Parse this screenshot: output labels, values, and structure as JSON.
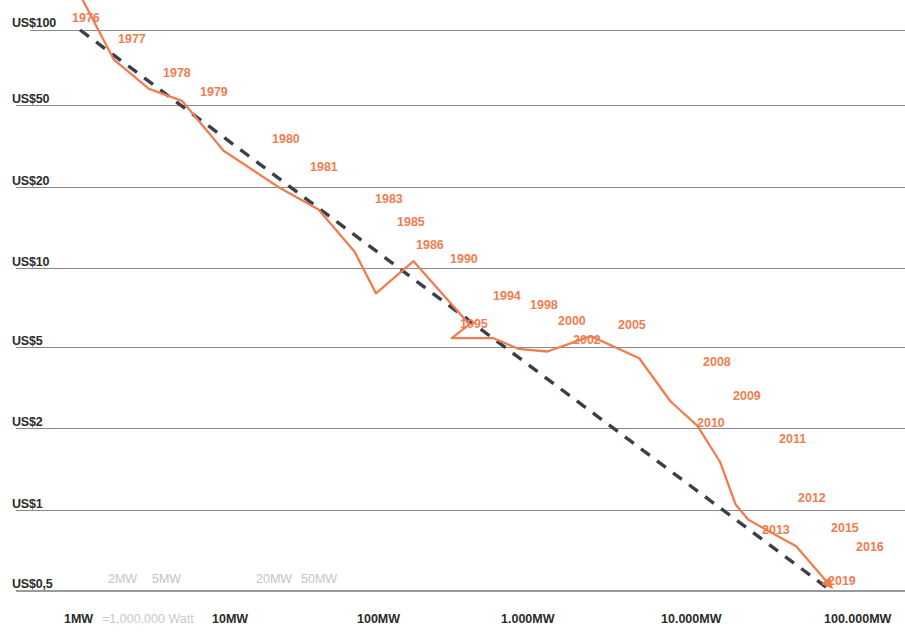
{
  "chart_data": {
    "type": "line",
    "title": "",
    "xlabel": "",
    "ylabel": "",
    "xscale": "log",
    "yscale": "log",
    "grid": true,
    "legend": "none",
    "xlim": [
      1,
      100000
    ],
    "ylim": [
      0.5,
      100
    ],
    "y_ticks": [
      "US$100",
      "US$50",
      "US$20",
      "US$10",
      "US$5",
      "US$2",
      "US$1",
      "US$0,5"
    ],
    "y_tick_values": [
      100,
      50,
      20,
      10,
      5,
      2,
      1,
      0.5
    ],
    "x_ticks_major": [
      "1MW",
      "10MW",
      "100MW",
      "1.000MW",
      "10.000MW",
      "100.000MW"
    ],
    "x_tick_major_values": [
      1,
      10,
      100,
      1000,
      10000,
      100000
    ],
    "x_ticks_minor": [
      "2MW",
      "5MW",
      "20MW",
      "50MW"
    ],
    "x_tick_minor_values": [
      2,
      5,
      20,
      50
    ],
    "x_note": "=1,000,000 Watt",
    "series": [
      {
        "name": "price-per-watt",
        "color": "#ef7d4e",
        "style": "solid",
        "points": [
          {
            "label": "1976",
            "x": 1.0,
            "y": 106.0
          },
          {
            "label": "1977",
            "x": 2.0,
            "y": 76.0
          },
          {
            "label": "1978",
            "x": 3.4,
            "y": 58.0
          },
          {
            "label": "1979",
            "x": 5.6,
            "y": 52.0
          },
          {
            "label": "1980",
            "x": 10.5,
            "y": 30.0
          },
          {
            "label": "1981",
            "x": 24.0,
            "y": 20.0
          },
          {
            "label": "1983",
            "x": 44.0,
            "y": 16.5
          },
          {
            "label": "1985",
            "x": 76.0,
            "y": 11.5
          },
          {
            "label": "1986",
            "x": 105.0,
            "y": 8.0
          },
          {
            "label": "1990",
            "x": 185.0,
            "y": 10.6
          },
          {
            "label": "1994",
            "x": 430.0,
            "y": 6.1
          },
          {
            "label": "1995",
            "x": 330.0,
            "y": 5.4
          },
          {
            "label": "1998",
            "x": 620.0,
            "y": 5.4
          },
          {
            "label": "2000",
            "x": 900.0,
            "y": 4.9
          },
          {
            "label": "2002",
            "x": 1400.0,
            "y": 4.75
          },
          {
            "label": "2005",
            "x": 2700.0,
            "y": 5.5
          },
          {
            "label": "2008",
            "x": 5600.0,
            "y": 4.4
          },
          {
            "label": "2009",
            "x": 9000.0,
            "y": 2.7
          },
          {
            "label": "2010",
            "x": 13500.0,
            "y": 2.05
          },
          {
            "label": "2011",
            "x": 19000.0,
            "y": 1.5
          },
          {
            "label": "2012",
            "x": 24000.0,
            "y": 1.05
          },
          {
            "label": "2013",
            "x": 29000.0,
            "y": 0.92
          },
          {
            "label": "2015",
            "x": 45000.0,
            "y": 0.8
          },
          {
            "label": "2016",
            "x": 60000.0,
            "y": 0.73
          },
          {
            "label": "2019",
            "x": 100000.0,
            "y": 0.52
          }
        ]
      },
      {
        "name": "learning-curve-trend",
        "color": "#39404c",
        "style": "dashed",
        "points": [
          {
            "x": 1.2,
            "y": 100.0
          },
          {
            "x": 100000.0,
            "y": 0.5
          }
        ]
      }
    ],
    "year_labels": [
      {
        "text": "1976",
        "x": 72,
        "y": 11
      },
      {
        "text": "1977",
        "x": 118,
        "y": 32
      },
      {
        "text": "1978",
        "x": 163,
        "y": 66
      },
      {
        "text": "1979",
        "x": 200,
        "y": 85
      },
      {
        "text": "1980",
        "x": 272,
        "y": 132
      },
      {
        "text": "1981",
        "x": 310,
        "y": 160
      },
      {
        "text": "1983",
        "x": 375,
        "y": 192
      },
      {
        "text": "1985",
        "x": 397,
        "y": 215
      },
      {
        "text": "1986",
        "x": 416,
        "y": 238
      },
      {
        "text": "1990",
        "x": 450,
        "y": 252
      },
      {
        "text": "1994",
        "x": 493,
        "y": 289
      },
      {
        "text": "1995",
        "x": 460,
        "y": 317
      },
      {
        "text": "1998",
        "x": 530,
        "y": 298
      },
      {
        "text": "2000",
        "x": 558,
        "y": 314
      },
      {
        "text": "2002",
        "x": 573,
        "y": 333
      },
      {
        "text": "2005",
        "x": 618,
        "y": 318
      },
      {
        "text": "2008",
        "x": 703,
        "y": 355
      },
      {
        "text": "2009",
        "x": 733,
        "y": 389
      },
      {
        "text": "2010",
        "x": 697,
        "y": 416
      },
      {
        "text": "2011",
        "x": 779,
        "y": 432
      },
      {
        "text": "2012",
        "x": 798,
        "y": 491
      },
      {
        "text": "2013",
        "x": 762,
        "y": 523
      },
      {
        "text": "2015",
        "x": 831,
        "y": 521
      },
      {
        "text": "2016",
        "x": 856,
        "y": 540
      },
      {
        "text": "2019",
        "x": 828,
        "y": 574
      }
    ],
    "gridline_y_px": [
      30,
      105,
      187,
      268,
      347,
      428,
      510,
      590
    ],
    "x_major_px": [
      68,
      215,
      360,
      505,
      665,
      830
    ],
    "x_minor_px": [
      110,
      153,
      258,
      303
    ]
  }
}
